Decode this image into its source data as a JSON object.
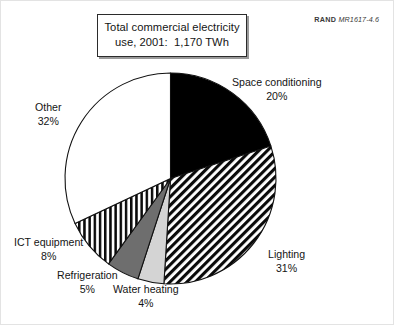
{
  "figure": {
    "title_lines": [
      "Total commercial electricity",
      "use, 2001:  1,170 TWh"
    ],
    "credit_prefix": "RAND",
    "credit_code": "MR1617-4.6"
  },
  "chart_data": {
    "type": "pie",
    "title": "Total commercial electricity use, 2001: 1,170 TWh",
    "total_label": "1,170 TWh",
    "total_value": 1170,
    "units": "TWh",
    "year": 2001,
    "value_units": "percent",
    "start_angle_deg": 0,
    "direction": "clockwise",
    "legend": "none-inline-labels",
    "grid": false,
    "categories": [
      "Space conditioning",
      "Lighting",
      "Water heating",
      "Refrigeration",
      "ICT equipment",
      "Other"
    ],
    "values": [
      20,
      31,
      4,
      5,
      8,
      32
    ],
    "slices": [
      {
        "label": "Space conditioning",
        "percent": 20,
        "percent_text": "20%",
        "fill": "solid-black",
        "color": "#000000",
        "label_position": "right-top"
      },
      {
        "label": "Lighting",
        "percent": 31,
        "percent_text": "31%",
        "fill": "diagonal-stripes",
        "color": "#000000",
        "label_position": "right-bottom"
      },
      {
        "label": "Water heating",
        "percent": 4,
        "percent_text": "4%",
        "fill": "solid-light-gray",
        "color": "#d4d4d4",
        "label_position": "bottom"
      },
      {
        "label": "Refrigeration",
        "percent": 5,
        "percent_text": "5%",
        "fill": "solid-dark-gray",
        "color": "#6e6e6e",
        "label_position": "bottom-left"
      },
      {
        "label": "ICT equipment",
        "percent": 8,
        "percent_text": "8%",
        "fill": "vertical-stripes",
        "color": "#000000",
        "label_position": "left-bottom"
      },
      {
        "label": "Other",
        "percent": 32,
        "percent_text": "32%",
        "fill": "solid-white",
        "color": "#ffffff",
        "label_position": "left-top"
      }
    ]
  }
}
